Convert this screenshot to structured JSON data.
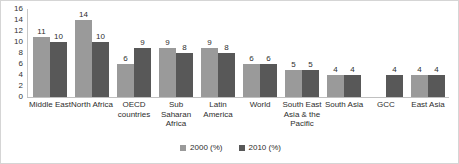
{
  "chart_data": {
    "type": "bar",
    "title": "",
    "subtitle": "",
    "xlabel": "",
    "ylabel": "",
    "ylim": [
      0,
      16
    ],
    "ytick_labels": [
      "16",
      "14",
      "12",
      "10",
      "8",
      "6",
      "4",
      "2",
      "0"
    ],
    "yticks": [
      16,
      14,
      12,
      10,
      8,
      6,
      4,
      2,
      0
    ],
    "grid": false,
    "legend_position": "bottom-center",
    "categories": [
      "Middle East",
      "North Africa",
      "OECD countries",
      "Sub Saharan Africa",
      "Latin America",
      "World",
      "South East Asia & the Pacific",
      "South Asia",
      "GCC",
      "East Asia"
    ],
    "series": [
      {
        "name": "2000 (%)",
        "color": "#9a9a9a",
        "values": [
          11,
          14,
          6,
          9,
          9,
          6,
          5,
          4,
          null,
          4
        ],
        "labels": [
          "11",
          "14",
          "6",
          "9",
          "9",
          "6",
          "5",
          "4",
          "",
          "4"
        ]
      },
      {
        "name": "2010 (%)",
        "color": "#585858",
        "values": [
          10,
          10,
          9,
          8,
          8,
          6,
          5,
          4,
          4,
          4
        ],
        "labels": [
          "10",
          "10",
          "9",
          "8",
          "8",
          "6",
          "5",
          "4",
          "4",
          "4"
        ]
      }
    ]
  },
  "legend": {
    "items": [
      {
        "label": "2000 (%)",
        "color": "#9a9a9a"
      },
      {
        "label": "2010 (%)",
        "color": "#585858"
      }
    ]
  }
}
